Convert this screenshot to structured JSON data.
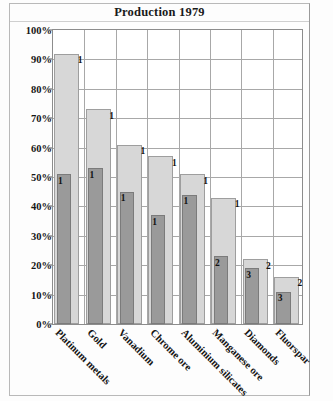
{
  "chart_data": {
    "type": "bar",
    "title": "Production 1979",
    "xlabel": "",
    "ylabel": "",
    "ylim": [
      0,
      100
    ],
    "ytick_labels": [
      "100%",
      "90%",
      "80%",
      "70%",
      "60%",
      "50%",
      "40%",
      "30%",
      "20%",
      "10%",
      "0%"
    ],
    "ytick_values": [
      100,
      90,
      80,
      70,
      60,
      50,
      40,
      30,
      20,
      10,
      0
    ],
    "grid": true,
    "legend": "none",
    "categories": [
      "Platinum metals",
      "Gold",
      "Vanadium",
      "Chrome ore",
      "Aluminium silicates",
      "Manganese ore",
      "Diamonds",
      "Fluorspar"
    ],
    "series": [
      {
        "name": "light",
        "color": "#d7d7d7",
        "values": [
          92,
          73,
          61,
          57,
          51,
          43,
          22,
          16
        ],
        "point_labels": [
          "1",
          "1",
          "1",
          "1",
          "1",
          "1",
          "2",
          "2"
        ]
      },
      {
        "name": "dark",
        "color": "#9a9a9a",
        "values": [
          51,
          53,
          45,
          37,
          44,
          23,
          19,
          11
        ],
        "point_labels": [
          "1",
          "1",
          "1",
          "1",
          "1",
          "2",
          "3",
          "3"
        ]
      }
    ]
  }
}
